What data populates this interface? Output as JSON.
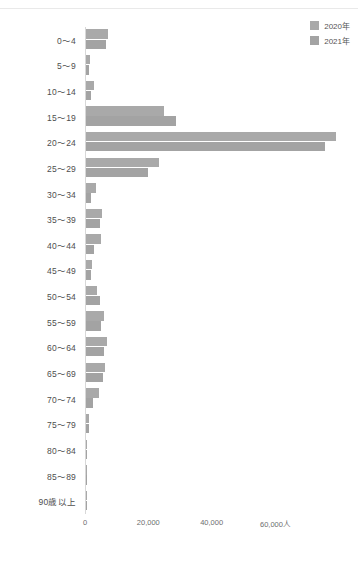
{
  "legend": {
    "position": "top-right",
    "items": [
      {
        "label": "2020年",
        "color": "#a9a9a9",
        "name": "2020"
      },
      {
        "label": "2021年",
        "color": "#a3a3a3",
        "name": "2021"
      }
    ]
  },
  "top_strip": {
    "ghost_text": ""
  },
  "bottom_caption": {
    "ghost_text": ""
  },
  "chart_data": {
    "type": "bar",
    "orientation": "horizontal",
    "title": "",
    "subtitle": "",
    "xlabel": "",
    "ylabel": "",
    "xlim": [
      0,
      66000
    ],
    "grid": false,
    "unit_suffix": "人",
    "xticks": [
      {
        "value": 0,
        "label": "0"
      },
      {
        "value": 20000,
        "label": "20,000"
      },
      {
        "value": 40000,
        "label": "40,000"
      },
      {
        "value": 60000,
        "label": "60,000人"
      }
    ],
    "categories": [
      "0〜4",
      "5〜9",
      "10〜14",
      "15〜19",
      "20〜24",
      "25〜29",
      "30〜34",
      "35〜39",
      "40〜44",
      "45〜49",
      "50〜54",
      "55〜59",
      "60〜64",
      "65〜69",
      "70〜74",
      "75〜79",
      "80〜84",
      "85〜89",
      "90歳以上"
    ],
    "series": [
      {
        "name": "2020年",
        "color": "#a9a9a9",
        "values": [
          6900,
          1300,
          2600,
          24500,
          79000,
          23000,
          3300,
          5200,
          4600,
          2000,
          3600,
          5600,
          6600,
          5900,
          4100,
          1100,
          300,
          200,
          150
        ]
      },
      {
        "name": "2021年",
        "color": "#a3a3a3",
        "values": [
          6300,
          1100,
          1500,
          28500,
          75500,
          19500,
          1700,
          4400,
          2600,
          1700,
          4500,
          4600,
          5700,
          5500,
          2100,
          900,
          250,
          200,
          150
        ]
      }
    ]
  }
}
